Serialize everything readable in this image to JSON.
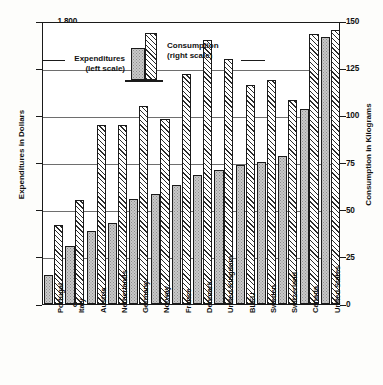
{
  "chart_data": {
    "type": "bar",
    "title": "",
    "subtitle": "",
    "xlabel": "",
    "ylabel": "Expenditures in Dollars",
    "y2label": "Consumption in Kilograms",
    "grid": true,
    "legend_position": "inside top-left",
    "categories": [
      "Portugal",
      "Italy",
      "Austria",
      "Netherlands",
      "Germany",
      "Norway",
      "France",
      "Denmark",
      "United Kingdom",
      "BLEU",
      "Sweden",
      "Switzerland",
      "Canada",
      "United States"
    ],
    "ylim": [
      0,
      1800
    ],
    "y2lim": [
      0,
      150
    ],
    "yticks": [
      "0",
      "300",
      "600",
      "900",
      "1,200",
      "1,500",
      "1,800"
    ],
    "ytick_values": [
      0,
      300,
      600,
      900,
      1200,
      1500,
      1800
    ],
    "y2ticks": [
      "0",
      "25",
      "50",
      "75",
      "100",
      "125",
      "150"
    ],
    "y2tick_values": [
      0,
      25,
      50,
      75,
      100,
      125,
      150
    ],
    "series": [
      {
        "name": "Expenditures",
        "legend_label": "Expenditures",
        "legend_sublabel": "(left scale)",
        "axis": "left",
        "units": "Dollars",
        "pattern": "stipple",
        "values": [
          185,
          370,
          465,
          515,
          665,
          700,
          760,
          820,
          850,
          885,
          905,
          940,
          1240,
          1700
        ]
      },
      {
        "name": "Consumption",
        "legend_label": "Consumption",
        "legend_sublabel": "(right scale)",
        "axis": "right",
        "units": "Kilograms",
        "pattern": "hatch",
        "values": [
          42,
          55,
          95,
          95,
          105,
          98,
          122,
          140,
          130,
          116,
          119,
          108,
          143,
          145
        ]
      }
    ]
  },
  "colors": {
    "expenditures_fill": "#c9c9c9",
    "consumption_fill": "#ffffff",
    "axis": "#1a1a1a",
    "grid": "#6e6e6e",
    "background": "#fdfdfb"
  }
}
